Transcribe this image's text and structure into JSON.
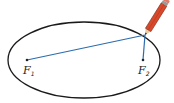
{
  "diagram": {
    "type": "ellipse-drawing-with-foci",
    "foci": [
      {
        "label": "F",
        "subscript": "1"
      },
      {
        "label": "F",
        "subscript": "2"
      }
    ],
    "colors": {
      "ellipse": "#1a1a1a",
      "string": "#2b6cb0",
      "pencil_body": "#d9482b",
      "pencil_wood": "#e8c9a0",
      "pencil_tip": "#333333"
    }
  }
}
